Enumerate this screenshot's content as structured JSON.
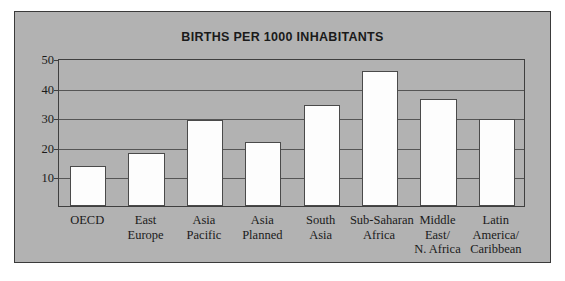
{
  "figure": {
    "background_color": "#b2b2b2",
    "border_color": "#3a3a3a",
    "bar_fill_color": "#fdfdfd",
    "bar_edge_color": "#4a4a4a",
    "axis_color": "#3f3f3f"
  },
  "chart_data": {
    "type": "bar",
    "title": "BIRTHS PER 1000 INHABITANTS",
    "xlabel": "",
    "ylabel": "",
    "ylim": [
      0,
      50
    ],
    "yticks": [
      10,
      20,
      30,
      40,
      50
    ],
    "ytick_labels": [
      "10",
      "20",
      "30",
      "40",
      "50"
    ],
    "grid": true,
    "grid_axis": "y",
    "legend": false,
    "categories": [
      "OECD",
      "East Europe",
      "Asia Pacific",
      "Asia Planned",
      "South Asia",
      "Sub-Saharan Africa",
      "Middle East/ N. Africa",
      "Latin America/ Caribbean"
    ],
    "category_lines": [
      [
        "OECD"
      ],
      [
        "East",
        "Europe"
      ],
      [
        "Asia",
        "Pacific"
      ],
      [
        "Asia",
        "Planned"
      ],
      [
        "South",
        "Asia"
      ],
      [
        "Sub-Saharan",
        "Africa"
      ],
      [
        "Middle",
        "East/",
        "N. Africa"
      ],
      [
        "Latin",
        "America/",
        "Caribbean"
      ]
    ],
    "values": [
      13.5,
      18,
      29,
      21.5,
      34,
      45.5,
      36,
      29.5
    ]
  }
}
